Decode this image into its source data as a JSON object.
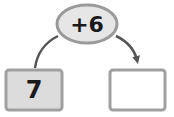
{
  "diagram": {
    "operator": {
      "label": "+6",
      "fill": "#e6e6e6",
      "stroke": "#9a9a9a"
    },
    "input_box": {
      "value": "7",
      "fill": "#dcdcdc",
      "stroke": "#a0a0a0"
    },
    "output_box": {
      "value": "",
      "fill": "#ffffff",
      "stroke": "#a0a0a0"
    },
    "arrow_color": "#555555"
  }
}
